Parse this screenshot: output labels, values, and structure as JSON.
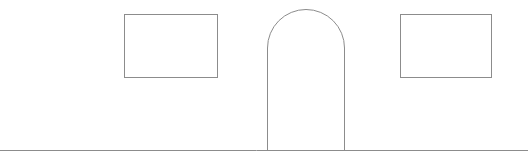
{
  "diagram": {
    "stroke_color": "#8c8c8c",
    "stroke_width": 1,
    "background": "#ffffff",
    "elements": {
      "window_left": {
        "x": 124,
        "y": 14,
        "width": 93,
        "height": 63
      },
      "door": {
        "x": 267,
        "y": 9,
        "width": 77,
        "bottom": 150,
        "arch_radius": 38.5
      },
      "window_right": {
        "x": 400,
        "y": 14,
        "width": 91,
        "height": 63
      },
      "ground_line": {
        "x1": 0,
        "x2": 528,
        "y": 150
      }
    }
  }
}
